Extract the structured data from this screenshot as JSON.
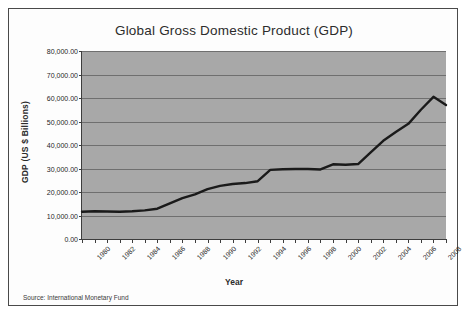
{
  "figure": {
    "title": "Global Gross Domestic Product (GDP)",
    "source_note": "Source: International Monetary Fund",
    "background_color": "#a8a8a8",
    "line_color": "#1a1a1a",
    "grid_color": "#6f6f6f",
    "frame_color": "#4a4a4a"
  },
  "chart_data": {
    "type": "line",
    "title": "Global Gross Domestic Product (GDP)",
    "xlabel": "Year",
    "ylabel": "GDP (US $ Billions)",
    "xlim": [
      1980,
      2009
    ],
    "ylim": [
      0,
      80000
    ],
    "grid": true,
    "legend": "none",
    "annotations": [
      "Source: International Monetary Fund"
    ],
    "ytick_labels": [
      "80,000.00",
      "70,000.00",
      "60,000.00",
      "50,000.00",
      "40,000.00",
      "30,000.00",
      "20,000.00",
      "10,000.00",
      "0.00"
    ],
    "ytick_values": [
      80000,
      70000,
      60000,
      50000,
      40000,
      30000,
      20000,
      10000,
      0
    ],
    "xtick_labels": [
      "1980",
      "1982",
      "1984",
      "1986",
      "1988",
      "1990",
      "1992",
      "1994",
      "1996",
      "1998",
      "2000",
      "2002",
      "2004",
      "2006",
      "2008"
    ],
    "xtick_values": [
      1980,
      1982,
      1984,
      1986,
      1988,
      1990,
      1992,
      1994,
      1996,
      1998,
      2000,
      2002,
      2004,
      2006,
      2008
    ],
    "x": [
      1980,
      1981,
      1982,
      1983,
      1984,
      1985,
      1986,
      1987,
      1988,
      1989,
      1990,
      1991,
      1992,
      1993,
      1994,
      1995,
      1996,
      1997,
      1998,
      1999,
      2000,
      2001,
      2002,
      2003,
      2004,
      2005,
      2006,
      2007,
      2008,
      2009
    ],
    "series": [
      {
        "name": "Global GDP (US $ Billions)",
        "values": [
          11600,
          11800,
          11700,
          11600,
          11800,
          12200,
          12900,
          15200,
          17400,
          19000,
          21200,
          22600,
          23400,
          23800,
          24600,
          29400,
          29700,
          29800,
          29800,
          29600,
          31800,
          31600,
          31900,
          36900,
          41800,
          45500,
          49000,
          55000,
          60500,
          57000
        ]
      }
    ]
  }
}
